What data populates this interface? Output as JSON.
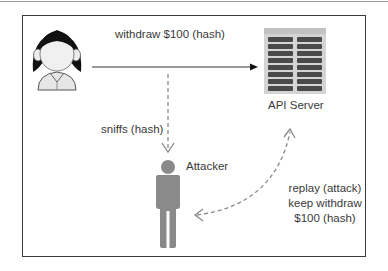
{
  "diagram": {
    "actors": {
      "user": {
        "icon": "user-woman-icon"
      },
      "server": {
        "icon": "server-rack-icon",
        "label": "API Server"
      },
      "attacker": {
        "icon": "person-icon",
        "label": "Attacker"
      }
    },
    "edges": {
      "request": {
        "label": "withdraw $100 (hash)",
        "style": "solid",
        "from": "user",
        "to": "server"
      },
      "sniff": {
        "label": "sniffs (hash)",
        "style": "dashed",
        "from": "request",
        "to": "attacker"
      },
      "replay": {
        "lines": [
          "replay (attack)",
          "keep withdraw",
          "$100 (hash)"
        ],
        "style": "dashed-curved-bidirectional",
        "from": "attacker",
        "to": "server"
      }
    },
    "colors": {
      "frame": "#3a3a3a",
      "text": "#3a3a3a",
      "attacker_fill": "#8a8a8a",
      "dashed_line": "#8a8a8a",
      "server_fill": "#d4d4d4",
      "server_slots": "#4a4a4a"
    }
  }
}
